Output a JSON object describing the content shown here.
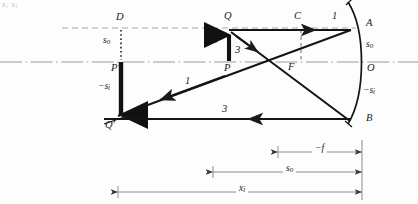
{
  "figure": {
    "kind": "concave-mirror-ray-diagram",
    "cut_off_top_text": "xᵢ   sᵢ",
    "colors": {
      "ink": "#1a1a1a",
      "axis": "#8c8c8c",
      "construction": "#9a9a9a",
      "dimension": "#8c8c8c",
      "background": "#fdfdfd"
    },
    "labels": {
      "D": "D",
      "Q": "Q",
      "C": "C",
      "A": "A",
      "P": "P",
      "F": "F",
      "O": "O",
      "B": "B",
      "P_prime": "P′",
      "Q_prime": "Q′",
      "s_o_upper": {
        "base": "s",
        "sub": "o"
      },
      "s_o_object": {
        "base": "s",
        "sub": "o"
      },
      "s_o_right": {
        "base": "s",
        "sub": "o"
      },
      "neg_s_i_left": {
        "base": "−s",
        "sub": "i"
      },
      "neg_s_i_right": {
        "base": "−s",
        "sub": "i"
      }
    },
    "ray_numbers": {
      "ray1_top": "1",
      "ray1_return": "1",
      "ray3_from_object": "3",
      "ray3_return": "3"
    },
    "dimensions": [
      {
        "name": "focal-length",
        "base": "−f",
        "sub": ""
      },
      {
        "name": "object-distance",
        "base": "s",
        "sub": "o"
      },
      {
        "name": "image-distance-newtonian",
        "base": "x",
        "sub": "i"
      }
    ]
  }
}
